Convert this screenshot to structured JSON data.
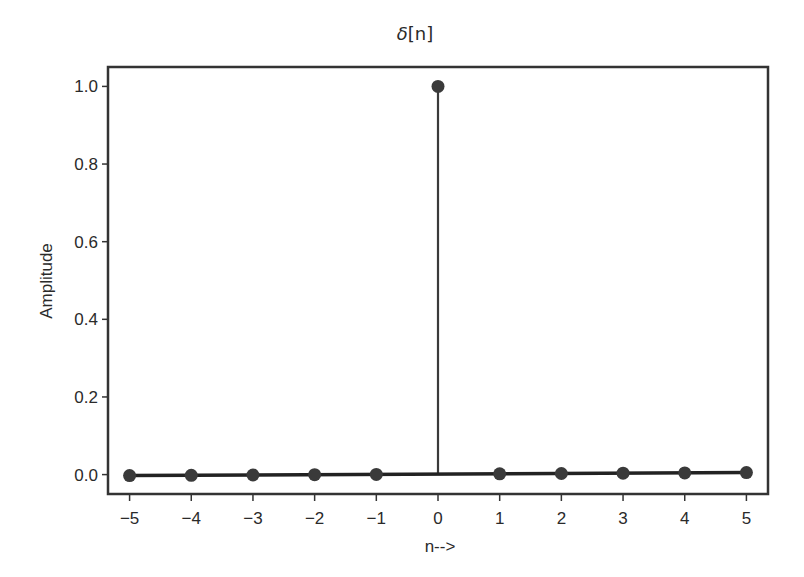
{
  "chart_data": {
    "type": "stem",
    "title": "δ[n]",
    "title_symbol": "δ",
    "title_rest": "[n]",
    "xlabel": "n-->",
    "ylabel": "Amplitude",
    "x": [
      -5,
      -4,
      -3,
      -2,
      -1,
      0,
      1,
      2,
      3,
      4,
      5
    ],
    "values": [
      0,
      0,
      0,
      0,
      0,
      1,
      0,
      0,
      0,
      0,
      0
    ],
    "xticks": [
      -5,
      -4,
      -3,
      -2,
      -1,
      0,
      1,
      2,
      3,
      4,
      5
    ],
    "xtick_labels": [
      "−5",
      "−4",
      "−3",
      "−2",
      "−1",
      "0",
      "1",
      "2",
      "3",
      "4",
      "5"
    ],
    "yticks": [
      0.0,
      0.2,
      0.4,
      0.6,
      0.8,
      1.0
    ],
    "ytick_labels": [
      "0.0",
      "0.2",
      "0.4",
      "0.6",
      "0.8",
      "1.0"
    ],
    "xlim": [
      -5.35,
      5.35
    ],
    "ylim": [
      -0.05,
      1.05
    ],
    "grid": false,
    "legend": null,
    "colors": {
      "stem": "#3a3a3a",
      "marker": "#3a3a3a",
      "baseline": "#222222",
      "frame": "#333333"
    }
  }
}
